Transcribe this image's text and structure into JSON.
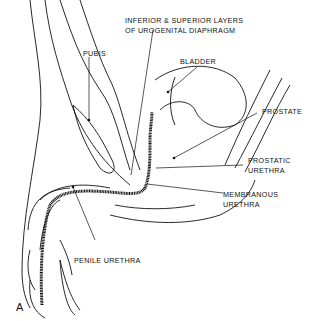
{
  "figure": {
    "panel_letter": "A",
    "labels": {
      "diaphragm_line1": "INFERIOR & SUPERIOR LAYERS",
      "diaphragm_line2": "OF UROGENITAL DIAPHRAGM",
      "bladder": "BLADDER",
      "pubis": "PUBIS",
      "prostate": "PROSTATE",
      "prostatic_line1": "PROSTATIC",
      "prostatic_line2": "URETHRA",
      "membranous_line1": "MEMBRANOUS",
      "membranous_line2": "URETHRA",
      "penile": "PENILE URETHRA"
    }
  }
}
